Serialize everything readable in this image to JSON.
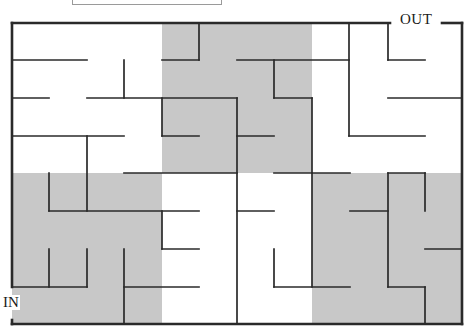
{
  "diagram": {
    "type": "maze",
    "labels": {
      "out": "OUT",
      "in": "IN"
    },
    "colors": {
      "wall": "#2a2a2a",
      "shade": "#c8c8c8",
      "background": "#ffffff",
      "title_box_border": "#9a9a9a"
    },
    "bounds": {
      "left": 12,
      "top": 23,
      "right": 462,
      "bottom": 324
    },
    "shaded_regions": [
      {
        "x": 162,
        "y": 23,
        "w": 150,
        "h": 150
      },
      {
        "x": 12,
        "y": 173,
        "w": 150,
        "h": 151
      },
      {
        "x": 312,
        "y": 173,
        "w": 150,
        "h": 151
      }
    ],
    "walls": [
      [
        12,
        23,
        390,
        23
      ],
      [
        442,
        23,
        462,
        23
      ],
      [
        462,
        23,
        462,
        324
      ],
      [
        12,
        324,
        462,
        324
      ],
      [
        12,
        23,
        12,
        287
      ],
      [
        12,
        320,
        12,
        324
      ],
      [
        12,
        60,
        87,
        60
      ],
      [
        162,
        60,
        199,
        60
      ],
      [
        199,
        23,
        199,
        60
      ],
      [
        237,
        60,
        349,
        60
      ],
      [
        349,
        23,
        349,
        136
      ],
      [
        388,
        23,
        388,
        60
      ],
      [
        388,
        60,
        425,
        60
      ],
      [
        124,
        60,
        124,
        98
      ],
      [
        274,
        60,
        274,
        98
      ],
      [
        12,
        98,
        49,
        98
      ],
      [
        87,
        98,
        237,
        98
      ],
      [
        274,
        98,
        312,
        98
      ],
      [
        388,
        98,
        462,
        98
      ],
      [
        162,
        98,
        162,
        136
      ],
      [
        237,
        98,
        237,
        324
      ],
      [
        312,
        98,
        312,
        173
      ],
      [
        12,
        136,
        124,
        136
      ],
      [
        162,
        136,
        199,
        136
      ],
      [
        237,
        136,
        274,
        136
      ],
      [
        349,
        136,
        425,
        136
      ],
      [
        87,
        136,
        87,
        211
      ],
      [
        124,
        173,
        237,
        173
      ],
      [
        274,
        173,
        350,
        173
      ],
      [
        388,
        173,
        425,
        173
      ],
      [
        49,
        173,
        49,
        211
      ],
      [
        312,
        173,
        312,
        287
      ],
      [
        388,
        173,
        388,
        287
      ],
      [
        425,
        173,
        425,
        211
      ],
      [
        49,
        211,
        199,
        211
      ],
      [
        237,
        211,
        274,
        211
      ],
      [
        350,
        211,
        388,
        211
      ],
      [
        162,
        211,
        162,
        249
      ],
      [
        162,
        249,
        199,
        249
      ],
      [
        425,
        249,
        462,
        249
      ],
      [
        49,
        249,
        49,
        287
      ],
      [
        87,
        249,
        87,
        287
      ],
      [
        124,
        249,
        124,
        324
      ],
      [
        274,
        249,
        274,
        287
      ],
      [
        12,
        287,
        87,
        287
      ],
      [
        124,
        287,
        199,
        287
      ],
      [
        274,
        287,
        350,
        287
      ],
      [
        388,
        287,
        425,
        287
      ],
      [
        425,
        287,
        425,
        324
      ]
    ]
  }
}
